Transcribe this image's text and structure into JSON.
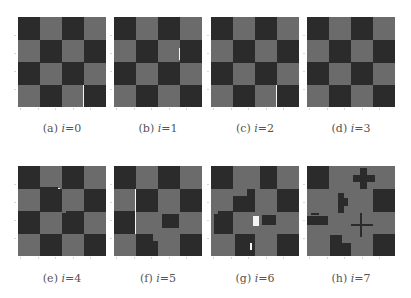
{
  "figure": {
    "colors": {
      "dark": "#2b2b2b",
      "light": "#6b6b6b",
      "highlight": "#f4f4f4"
    },
    "grid_size": 4,
    "panels": [
      {
        "id": "a",
        "label": "(a)",
        "caption_var": "i",
        "caption_eq": "=0",
        "caption": "(a) i=0",
        "pattern": [
          [
            1,
            0,
            1,
            0
          ],
          [
            0,
            1,
            0,
            1
          ],
          [
            1,
            0,
            1,
            0
          ],
          [
            0,
            1,
            0,
            1
          ]
        ],
        "overlays": [
          {
            "type": "white",
            "x": 0.735,
            "y": 0.75,
            "w": 0.02,
            "h": 0.25
          }
        ]
      },
      {
        "id": "b",
        "label": "(b)",
        "caption_var": "i",
        "caption_eq": "=1",
        "caption": "(b) i=1",
        "pattern": [
          [
            1,
            0,
            1,
            0
          ],
          [
            0,
            1,
            0,
            1
          ],
          [
            1,
            0,
            1,
            0
          ],
          [
            0,
            1,
            0,
            1
          ]
        ],
        "overlays": [
          {
            "type": "white",
            "x": 0.74,
            "y": 0.34,
            "w": 0.015,
            "h": 0.14
          }
        ]
      },
      {
        "id": "c",
        "label": "(c)",
        "caption_var": "i",
        "caption_eq": "=2",
        "caption": "(c) i=2",
        "pattern": [
          [
            1,
            0,
            1,
            0
          ],
          [
            0,
            1,
            0,
            1
          ],
          [
            1,
            0,
            1,
            0
          ],
          [
            0,
            1,
            0,
            1
          ]
        ],
        "overlays": [
          {
            "type": "white",
            "x": 0.74,
            "y": 0.75,
            "w": 0.015,
            "h": 0.25
          }
        ]
      },
      {
        "id": "d",
        "label": "(d)",
        "caption_var": "i",
        "caption_eq": "=3",
        "caption": "(d) i=3",
        "pattern": [
          [
            1,
            0,
            1,
            0
          ],
          [
            0,
            1,
            0,
            1
          ],
          [
            1,
            0,
            1,
            0
          ],
          [
            0,
            1,
            0,
            1
          ]
        ],
        "overlays": []
      },
      {
        "id": "e",
        "label": "(e)",
        "caption_var": "i",
        "caption_eq": "=4",
        "caption": "(e) i=4",
        "pattern": [
          [
            1,
            0,
            1,
            0
          ],
          [
            0,
            1,
            0,
            1
          ],
          [
            1,
            0,
            1,
            0
          ],
          [
            0,
            1,
            0,
            1
          ]
        ],
        "overlays": [
          {
            "type": "dark",
            "x": 0.25,
            "y": 0.23,
            "w": 0.2,
            "h": 0.03
          },
          {
            "type": "white",
            "x": 0.46,
            "y": 0.24,
            "w": 0.02,
            "h": 0.02
          },
          {
            "type": "light",
            "x": 0.5,
            "y": 0.5,
            "w": 0.04,
            "h": 0.02
          }
        ]
      },
      {
        "id": "f",
        "label": "(f)",
        "caption_var": "i",
        "caption_eq": "=5",
        "caption": "(f) i=5",
        "pattern": [
          [
            1,
            0,
            1,
            0
          ],
          [
            0,
            1,
            0,
            1
          ],
          [
            1,
            0,
            0,
            0
          ],
          [
            0,
            1,
            0,
            1
          ]
        ],
        "overlays": [
          {
            "type": "white",
            "x": 0.24,
            "y": 0.25,
            "w": 0.015,
            "h": 0.5
          },
          {
            "type": "light",
            "x": 0.5,
            "y": 0.25,
            "w": 0.25,
            "h": 0.25
          },
          {
            "type": "dark",
            "x": 0.54,
            "y": 0.53,
            "w": 0.2,
            "h": 0.16
          },
          {
            "type": "light",
            "x": 0.44,
            "y": 0.75,
            "w": 0.06,
            "h": 0.08
          }
        ]
      },
      {
        "id": "g",
        "label": "(g)",
        "caption_var": "i",
        "caption_eq": "=6",
        "caption": "(g) i=6",
        "pattern": [
          [
            1,
            0,
            1,
            0
          ],
          [
            0,
            1,
            0,
            1
          ],
          [
            1,
            0,
            0,
            0
          ],
          [
            0,
            1,
            0,
            1
          ]
        ],
        "overlays": [
          {
            "type": "light",
            "x": 0.5,
            "y": 0.0,
            "w": 0.06,
            "h": 0.25
          },
          {
            "type": "light",
            "x": 0.25,
            "y": 0.25,
            "w": 0.16,
            "h": 0.08
          },
          {
            "type": "dark",
            "x": 0.5,
            "y": 0.33,
            "w": 0.0,
            "h": 0.0
          },
          {
            "type": "light",
            "x": 0.0,
            "y": 0.5,
            "w": 0.03,
            "h": 0.25
          },
          {
            "type": "light",
            "x": 0.0,
            "y": 0.5,
            "w": 0.08,
            "h": 0.03
          },
          {
            "type": "dark",
            "x": 0.58,
            "y": 0.54,
            "w": 0.16,
            "h": 0.12
          },
          {
            "type": "white",
            "x": 0.48,
            "y": 0.55,
            "w": 0.06,
            "h": 0.12
          },
          {
            "type": "white",
            "x": 0.44,
            "y": 0.86,
            "w": 0.03,
            "h": 0.07
          },
          {
            "type": "light",
            "x": 0.25,
            "y": 0.75,
            "w": 0.02,
            "h": 0.25
          }
        ]
      },
      {
        "id": "h",
        "label": "(h)",
        "caption_var": "i",
        "caption_eq": "=7",
        "caption": "(h) i=7",
        "pattern": [
          [
            1,
            0,
            0,
            0
          ],
          [
            0,
            0,
            0,
            1
          ],
          [
            0,
            0,
            0,
            0
          ],
          [
            0,
            0,
            0,
            1
          ]
        ],
        "overlays": [
          {
            "type": "dark",
            "x": 0.52,
            "y": 0.1,
            "w": 0.25,
            "h": 0.08
          },
          {
            "type": "dark",
            "x": 0.6,
            "y": 0.02,
            "w": 0.08,
            "h": 0.24
          },
          {
            "type": "dark",
            "x": 0.35,
            "y": 0.3,
            "w": 0.07,
            "h": 0.22
          },
          {
            "type": "dark",
            "x": 0.42,
            "y": 0.36,
            "w": 0.05,
            "h": 0.08
          },
          {
            "type": "dark",
            "x": 0.0,
            "y": 0.55,
            "w": 0.24,
            "h": 0.1
          },
          {
            "type": "dark",
            "x": 0.04,
            "y": 0.52,
            "w": 0.1,
            "h": 0.03
          },
          {
            "type": "dark",
            "x": 0.5,
            "y": 0.64,
            "w": 0.25,
            "h": 0.03
          },
          {
            "type": "dark",
            "x": 0.6,
            "y": 0.52,
            "w": 0.03,
            "h": 0.27
          },
          {
            "type": "dark",
            "x": 0.26,
            "y": 0.77,
            "w": 0.14,
            "h": 0.23
          },
          {
            "type": "dark",
            "x": 0.4,
            "y": 0.85,
            "w": 0.1,
            "h": 0.15
          }
        ]
      }
    ]
  }
}
